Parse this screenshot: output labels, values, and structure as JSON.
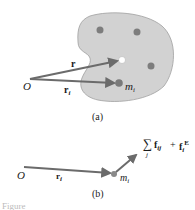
{
  "panel_a": {
    "origin_label": "O",
    "vector_r_label": "r",
    "vector_ri_label": "r",
    "vector_ri_sub": "i",
    "mass_label": "m",
    "mass_sub": "i",
    "caption": "(a)"
  },
  "panel_b": {
    "origin_label": "O",
    "vector_ri_label": "r",
    "vector_ri_sub": "i",
    "mass_label": "m",
    "mass_sub": "i",
    "force_sum_symbol": "∑",
    "force_sum_index": "j",
    "force_internal": "f",
    "force_internal_sub": "ij",
    "plus": "+",
    "force_external": "f",
    "force_external_sub": "i",
    "force_external_sup": "E",
    "caption": "(b)"
  },
  "colors": {
    "body_fill": "#cfcfcf",
    "body_stroke": "#9a9a9a",
    "particle": "#7a7a7a",
    "vector": "#6b6b6b",
    "center": "#ffffff"
  },
  "footer_fragment": "Figure"
}
